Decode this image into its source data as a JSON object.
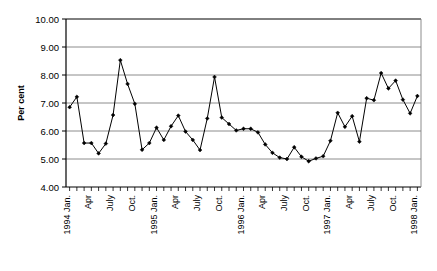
{
  "chart_data": {
    "type": "line",
    "title": "",
    "xlabel": "",
    "ylabel": "Per cent",
    "ylim": [
      4.0,
      10.0
    ],
    "ytick_step": 1.0,
    "ytick_labels": [
      "10.00",
      "9.00",
      "8.00",
      "7.00",
      "6.00",
      "5.00",
      "4.00"
    ],
    "ytick_values": [
      10.0,
      9.0,
      8.0,
      7.0,
      6.0,
      5.0,
      4.0
    ],
    "grid": "horizontal",
    "legend": "none",
    "marker": "filled-diamond",
    "line_color": "#000000",
    "grid_color": "#808080",
    "axis_color": "#000000",
    "x_tick_label_rotation": -90,
    "x_labels_shown": [
      {
        "index": 0,
        "label": "1994 Jan."
      },
      {
        "index": 3,
        "label": "Apr"
      },
      {
        "index": 6,
        "label": "July"
      },
      {
        "index": 9,
        "label": "Oct."
      },
      {
        "index": 12,
        "label": "1995 Jan."
      },
      {
        "index": 15,
        "label": "Apr"
      },
      {
        "index": 18,
        "label": "July"
      },
      {
        "index": 21,
        "label": "Oct."
      },
      {
        "index": 24,
        "label": "1996 Jan."
      },
      {
        "index": 27,
        "label": "Apr"
      },
      {
        "index": 30,
        "label": "July"
      },
      {
        "index": 33,
        "label": "Oct."
      },
      {
        "index": 36,
        "label": "1997 Jan."
      },
      {
        "index": 39,
        "label": "Apr"
      },
      {
        "index": 42,
        "label": "July"
      },
      {
        "index": 45,
        "label": "Oct."
      },
      {
        "index": 48,
        "label": "1998 Jan."
      }
    ],
    "x": [
      "1994 Jan.",
      "1994 Feb.",
      "1994 Mar.",
      "1994 Apr",
      "1994 May",
      "1994 June",
      "1994 July",
      "1994 Aug.",
      "1994 Sep.",
      "1994 Oct.",
      "1994 Nov.",
      "1994 Dec.",
      "1995 Jan.",
      "1995 Feb.",
      "1995 Mar.",
      "1995 Apr",
      "1995 May",
      "1995 June",
      "1995 July",
      "1995 Aug.",
      "1995 Sep.",
      "1995 Oct.",
      "1995 Nov.",
      "1995 Dec.",
      "1996 Jan.",
      "1996 Feb.",
      "1996 Mar.",
      "1996 Apr",
      "1996 May",
      "1996 June",
      "1996 July",
      "1996 Aug.",
      "1996 Sep.",
      "1996 Oct.",
      "1996 Nov.",
      "1996 Dec.",
      "1997 Jan.",
      "1997 Feb.",
      "1997 Mar.",
      "1997 Apr",
      "1997 May",
      "1997 June",
      "1997 July",
      "1997 Aug.",
      "1997 Sep.",
      "1997 Oct.",
      "1997 Nov.",
      "1997 Dec.",
      "1998 Jan."
    ],
    "values": [
      6.85,
      7.22,
      5.57,
      5.57,
      5.2,
      5.55,
      6.57,
      8.53,
      7.68,
      6.97,
      5.33,
      5.57,
      6.12,
      5.68,
      6.17,
      6.55,
      5.98,
      5.68,
      5.32,
      6.45,
      7.93,
      6.48,
      6.25,
      6.02,
      6.08,
      6.08,
      5.95,
      5.52,
      5.22,
      5.05,
      5.0,
      5.42,
      5.08,
      4.92,
      5.02,
      5.1,
      5.65,
      6.65,
      6.15,
      6.53,
      5.62,
      7.17,
      7.1,
      8.07,
      7.52,
      7.8,
      7.12,
      6.63,
      7.25
    ],
    "series_name": "Per cent"
  }
}
